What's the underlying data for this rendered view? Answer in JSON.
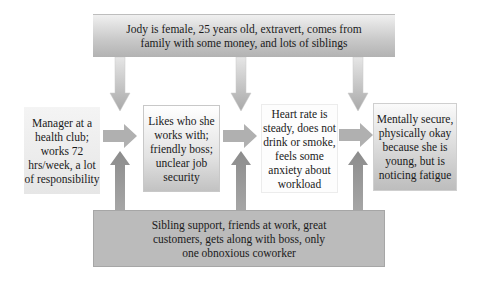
{
  "diagram": {
    "type": "flow-diagram",
    "top_box": {
      "text": "Jody is female, 25 years old, extravert, comes from family with some money, and lots of siblings"
    },
    "stages": [
      {
        "id": "stage-1",
        "text": "Manager at a health club; works 72 hrs/week, a lot of responsibility"
      },
      {
        "id": "stage-2",
        "text": "Likes who she works with; friendly boss; unclear job security"
      },
      {
        "id": "stage-3",
        "text": "Heart rate is steady, does not drink or smoke, feels some anxiety about workload"
      },
      {
        "id": "stage-4",
        "text": "Mentally secure, physically okay because she is young, but is noticing fatigue"
      }
    ],
    "bottom_box": {
      "text": "Sibling support, friends at work, great customers, gets along with boss, only one obnoxious coworker"
    },
    "arrows": {
      "down_from_top": [
        "into-arrow-1-2",
        "into-arrow-2-3",
        "into-arrow-3-4"
      ],
      "right_between_stages": [
        "stage-1 -> stage-2",
        "stage-2 -> stage-3",
        "stage-3 -> stage-4"
      ],
      "up_from_bottom": [
        "into-arrow-1-2",
        "into-arrow-2-3",
        "into-arrow-3-4"
      ]
    },
    "colors": {
      "top_box_gradient_top": "#f0f0f0",
      "top_box_gradient_bottom": "#b2b2b2",
      "bottom_box": "#bbbbbb",
      "arrow_light": "#d4d4d4",
      "arrow_mid": "#a8a8a8",
      "arrow_dark": "#8a8a8a"
    }
  }
}
